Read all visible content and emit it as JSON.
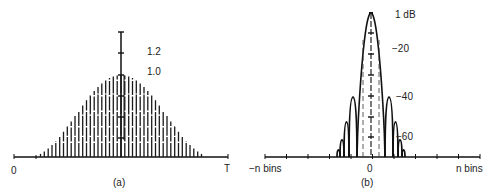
{
  "chart_data": [
    {
      "type": "bar",
      "panel": "(a)",
      "description": "Window function in time domain: sampled bell-shaped window with vertical scale marker",
      "x_axis": {
        "start_label": "0",
        "end_label": "T"
      },
      "y_markers": [
        "1.2",
        "1.0"
      ],
      "peak_value": 1.0,
      "marker_top": 1.2,
      "num_samples": 49,
      "shape": "bell (cosine-squared-like taper)"
    },
    {
      "type": "line",
      "panel": "(b)",
      "description": "Frequency response of window: main lobe with sidelobes, dB scale",
      "x_axis": {
        "left_label": "−n bins",
        "center_label": "0",
        "right_label": "n bins"
      },
      "y_tick_labels": [
        "1 dB",
        "−20",
        "−40",
        "−60"
      ],
      "y_values_db": [
        1,
        -20,
        -40,
        -60
      ],
      "sidelobe_levels_db": [
        -40,
        -52,
        -62,
        -70
      ]
    }
  ],
  "panel_a": {
    "caption": "(a)",
    "x_start": "0",
    "x_end": "T",
    "label_top": "1.2",
    "label_peak": "1.0"
  },
  "panel_b": {
    "caption": "(b)",
    "x_left": "−n bins",
    "x_center": "0",
    "x_right": "n bins",
    "label_1db": "1 dB",
    "label_20": "−20",
    "label_40": "−40",
    "label_60": "−60"
  }
}
